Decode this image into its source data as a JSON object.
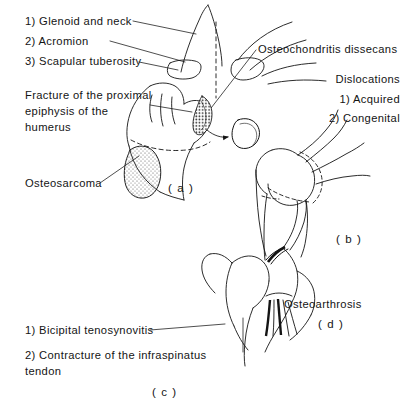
{
  "figure": {
    "background_color": "#ffffff",
    "ink_color": "#141414",
    "labels": {
      "glenoid_and_neck": "1) Glenoid and neck",
      "acromion": "2) Acromion",
      "scapular_tuberosity": "3) Scapular tuberosity",
      "fracture_of_proximal_epiphysis": "Fracture of the proximal epiphysis of the humerus",
      "osteosarcoma": "Osteosarcoma",
      "osteochondritis_dissecans": "Osteochondritis dissecans",
      "dislocations": "Dislocations",
      "dislocation_acquired": "1) Acquired",
      "dislocation_congenital": "2) Congenital",
      "osteoarthrosis": "Osteoarthrosis",
      "bicipital_tenosynovitis": "1) Bicipital tenosynovitis",
      "contracture_infraspinatus": "2) Contracture of the infraspinatus tendon"
    },
    "panels": [
      {
        "letter": "( a )",
        "subject": "scapula-and-proximal-humerus"
      },
      {
        "letter": "( b )",
        "subject": "shoulder-joint-dislocation"
      },
      {
        "letter": "( c )",
        "subject": "humeral-head-tendons"
      },
      {
        "letter": "( d )",
        "subject": "osteoarthrosis"
      }
    ]
  }
}
